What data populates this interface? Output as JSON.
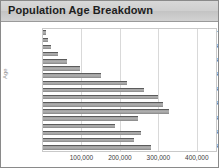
{
  "chart_data": {
    "type": "bar",
    "orientation": "horizontal",
    "title": "Population Age Breakdown",
    "xlabel": "",
    "ylabel": "Age",
    "categories": [
      "80+",
      "75-79",
      "70-74",
      "65-69",
      "60-64",
      "55-59",
      "50-54",
      "45-49",
      "40-44",
      "35-39",
      "30-34",
      "25-29",
      "20-24",
      "15-19",
      "10-14",
      "5-9",
      "0-4"
    ],
    "values": [
      8000,
      14000,
      22000,
      38000,
      62000,
      96000,
      152000,
      218000,
      262000,
      298000,
      312000,
      327000,
      248000,
      186000,
      256000,
      236000,
      282000
    ],
    "xlim": [
      0,
      450000
    ],
    "ylim": null,
    "x_ticks": [
      100000,
      200000,
      300000,
      400000
    ],
    "x_tick_labels": [
      "100,000",
      "200,000",
      "300,000",
      "400,000"
    ],
    "y_tick_labels_shown": [
      "80+",
      "70-74",
      "60-64",
      "50-54",
      "40-44",
      "30-34",
      "20-24",
      "10-14",
      "0-4"
    ],
    "grid": true,
    "legend": false,
    "colors": {
      "bar_fill": "#a8a8a8",
      "bar_top_edge": "#5b5b5b",
      "gridline": "#d9d9d9",
      "title_band": "#cfcfcf",
      "plot_border": "#c9c9c9",
      "card_border": "#8a8a8a",
      "tick_text": "#3c3c3c"
    }
  },
  "axes": {
    "y_title": "Age",
    "y_labels": [
      {
        "cat": "80+",
        "show": true
      },
      {
        "cat": "75-79",
        "show": false
      },
      {
        "cat": "70-74",
        "show": true
      },
      {
        "cat": "65-69",
        "show": false
      },
      {
        "cat": "60-64",
        "show": true
      },
      {
        "cat": "55-59",
        "show": false
      },
      {
        "cat": "50-54",
        "show": true
      },
      {
        "cat": "45-49",
        "show": false
      },
      {
        "cat": "40-44",
        "show": true
      },
      {
        "cat": "35-39",
        "show": false
      },
      {
        "cat": "30-34",
        "show": true
      },
      {
        "cat": "25-29",
        "show": false
      },
      {
        "cat": "20-24",
        "show": true
      },
      {
        "cat": "15-19",
        "show": false
      },
      {
        "cat": "10-14",
        "show": true
      },
      {
        "cat": "5-9",
        "show": false
      },
      {
        "cat": "0-4",
        "show": true
      }
    ]
  }
}
